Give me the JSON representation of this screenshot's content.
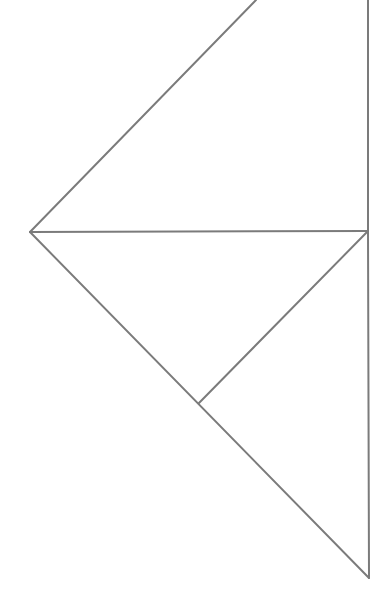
{
  "diagram": {
    "type": "geometric-line-figure",
    "width": 387,
    "height": 612,
    "background": "#ffffff",
    "stroke_color": "#7b7b7b",
    "stroke_width": 2,
    "points": {
      "top": [
        256,
        0
      ],
      "top_right": [
        368,
        0
      ],
      "left": [
        30,
        232
      ],
      "right": [
        368,
        231
      ],
      "inner": [
        199,
        403
      ],
      "bottom": [
        369,
        578
      ]
    },
    "segments": [
      {
        "name": "upper-diagonal",
        "from": "left",
        "to": "top"
      },
      {
        "name": "right-vertical-upper",
        "from": "top_right",
        "to": "right"
      },
      {
        "name": "horizontal-middle",
        "from": "left",
        "to": "right"
      },
      {
        "name": "lower-long-diagonal",
        "from": "left",
        "to": "bottom"
      },
      {
        "name": "inner-diagonal",
        "from": "right",
        "to": "inner"
      },
      {
        "name": "right-vertical-lower",
        "from": "right",
        "to": "bottom"
      }
    ]
  }
}
